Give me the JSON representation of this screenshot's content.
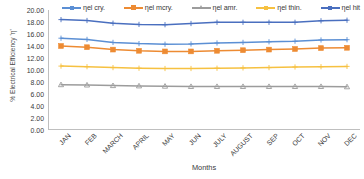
{
  "chart_data": {
    "type": "line",
    "title": "",
    "xlabel": "Months",
    "ylabel": "% Electrical Efficiency 'η'",
    "categories": [
      "JAN",
      "FEB",
      "MARCH",
      "APRIL",
      "MAY",
      "JUN",
      "JULY",
      "AUGUST",
      "SEP",
      "OCT",
      "NOV",
      "DEC"
    ],
    "ylim": [
      0.0,
      20.0
    ],
    "ytick_step": 2.0,
    "ytick_labels": [
      "20.00",
      "18.00",
      "16.00",
      "14.00",
      "12.00",
      "10.00",
      "8.00",
      "6.00",
      "4.00",
      "2.00",
      "0.00"
    ],
    "ytick_values": [
      20.0,
      18.0,
      16.0,
      14.0,
      12.0,
      10.0,
      8.0,
      6.0,
      4.0,
      2.0,
      0.0
    ],
    "grid": false,
    "legend_position": "top",
    "series": [
      {
        "name": "ηel cry.",
        "color": "#5B8FD4",
        "marker": "plus",
        "values": [
          15.3,
          15.1,
          14.6,
          14.4,
          14.3,
          14.35,
          14.5,
          14.6,
          14.7,
          14.8,
          15.0,
          15.05
        ]
      },
      {
        "name": "ηel mcry.",
        "color": "#ED8B33",
        "marker": "square",
        "values": [
          14.0,
          13.8,
          13.4,
          13.2,
          13.1,
          13.1,
          13.2,
          13.3,
          13.4,
          13.5,
          13.65,
          13.7
        ]
      },
      {
        "name": "ηel amr.",
        "color": "#9C9C9C",
        "marker": "triangle",
        "values": [
          7.55,
          7.5,
          7.4,
          7.35,
          7.3,
          7.25,
          7.25,
          7.25,
          7.25,
          7.25,
          7.25,
          7.2
        ]
      },
      {
        "name": "ηel thin.",
        "color": "#F6C141",
        "marker": "plus",
        "values": [
          10.65,
          10.55,
          10.4,
          10.3,
          10.25,
          10.25,
          10.3,
          10.35,
          10.4,
          10.5,
          10.55,
          10.6
        ]
      },
      {
        "name": "ηel hit",
        "color": "#4A6FBF",
        "marker": "plus",
        "values": [
          18.4,
          18.25,
          17.8,
          17.6,
          17.55,
          17.75,
          17.95,
          17.95,
          17.95,
          17.95,
          18.2,
          18.3
        ]
      }
    ]
  }
}
